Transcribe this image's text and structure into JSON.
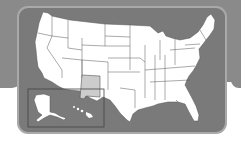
{
  "map": {
    "title": "",
    "subject": "United States map",
    "highlighted_state": "New Mexico",
    "inset_regions": [
      "Alaska",
      "Hawaii"
    ],
    "colors": {
      "background_band": "#8a8a8a",
      "panel": "#7a7a7a",
      "panel_border": "#a9a9a9",
      "state_fill": "#ffffff",
      "highlight_fill": "#cccccc",
      "state_outline": "#555555"
    }
  }
}
